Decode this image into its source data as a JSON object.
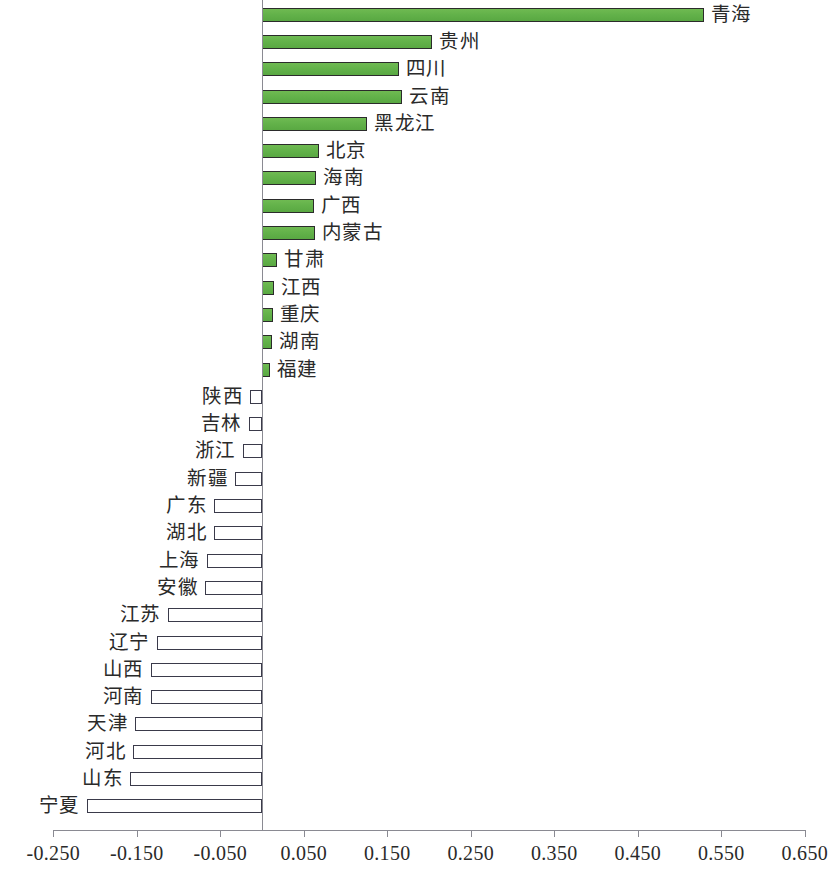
{
  "chart_data": {
    "type": "bar",
    "orientation": "horizontal",
    "title": "",
    "subtitle": "",
    "xlabel": "",
    "ylabel": "",
    "grid": false,
    "legend": null,
    "xlim": [
      -0.25,
      0.65
    ],
    "xtick_labels": [
      "-0.250",
      "-0.150",
      "-0.050",
      "0.050",
      "0.150",
      "0.250",
      "0.350",
      "0.450",
      "0.550",
      "0.650"
    ],
    "xticks": [
      -0.25,
      -0.15,
      -0.05,
      0.05,
      0.15,
      0.25,
      0.35,
      0.45,
      0.55,
      0.65
    ],
    "colors": {
      "positive_fill": "#63b24a",
      "positive_border": "#2b2b2b",
      "negative_fill": "#ffffff",
      "negative_border": "#3a3a4a",
      "axis": "#8a8a92",
      "text": "#2a2a2a"
    },
    "categories": [
      "青海",
      "贵州",
      "四川",
      "云南",
      "黑龙江",
      "北京",
      "海南",
      "广西",
      "内蒙古",
      "甘肃",
      "江西",
      "重庆",
      "湖南",
      "福建",
      "陕西",
      "吉林",
      "浙江",
      "新疆",
      "广东",
      "湖北",
      "上海",
      "安徽",
      "江苏",
      "辽宁",
      "山西",
      "河南",
      "天津",
      "河北",
      "山东",
      "宁夏"
    ],
    "values": [
      0.529,
      0.204,
      0.164,
      0.168,
      0.126,
      0.068,
      0.065,
      0.062,
      0.063,
      0.018,
      0.014,
      0.013,
      0.012,
      0.009,
      -0.014,
      -0.016,
      -0.023,
      -0.032,
      -0.057,
      -0.057,
      -0.066,
      -0.068,
      -0.113,
      -0.126,
      -0.133,
      -0.133,
      -0.152,
      -0.154,
      -0.158,
      -0.21
    ]
  }
}
